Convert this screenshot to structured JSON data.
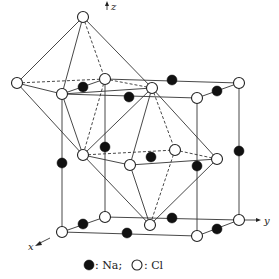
{
  "figure": {
    "axes": {
      "x": "x",
      "y": "y",
      "z": "z"
    },
    "legend": {
      "na_label": ": Na;",
      "cl_label": ": Cl"
    },
    "colors": {
      "na": "#111111",
      "cl": "#ffffff",
      "line": "#333333"
    }
  },
  "atoms": {
    "cl": [
      [
        83,
        17
      ],
      [
        17,
        83
      ],
      [
        62,
        94
      ],
      [
        105,
        79
      ],
      [
        152,
        88
      ],
      [
        197,
        98
      ],
      [
        239,
        83
      ],
      [
        83,
        155
      ],
      [
        130,
        165
      ],
      [
        175,
        150
      ],
      [
        217,
        159
      ],
      [
        62,
        232
      ],
      [
        105,
        217
      ],
      [
        150,
        225
      ],
      [
        197,
        236
      ],
      [
        239,
        220
      ]
    ],
    "na": [
      [
        83,
        87
      ],
      [
        129,
        97
      ],
      [
        172,
        80
      ],
      [
        217,
        91
      ],
      [
        62,
        163
      ],
      [
        105,
        147
      ],
      [
        151,
        157
      ],
      [
        197,
        166
      ],
      [
        239,
        151
      ],
      [
        83,
        224
      ],
      [
        127,
        233
      ],
      [
        172,
        218
      ],
      [
        217,
        229
      ]
    ]
  }
}
